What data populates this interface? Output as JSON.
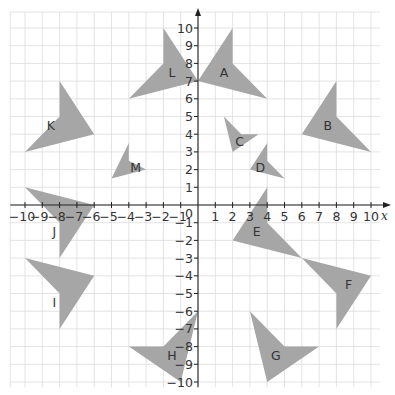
{
  "figure": {
    "type": "coordinate-grid-with-shapes",
    "x_range": [
      -10,
      10
    ],
    "y_range": [
      -10,
      10
    ],
    "x_axis_label": "x",
    "origin_label": "0",
    "x_ticks": [
      -10,
      -9,
      -8,
      -7,
      -6,
      -5,
      -4,
      -3,
      -2,
      -1,
      1,
      2,
      3,
      4,
      5,
      6,
      7,
      8,
      9,
      10
    ],
    "y_ticks": [
      -10,
      -9,
      -8,
      -7,
      -6,
      -5,
      -4,
      -3,
      -2,
      -1,
      1,
      2,
      3,
      4,
      5,
      6,
      7,
      8,
      9,
      10
    ],
    "colors": {
      "shape_fill": "#a6a6a6",
      "grid": "#dcdcdc",
      "axis": "#222222",
      "text": "#333333"
    }
  },
  "shapes": [
    {
      "label": "A",
      "vertices": [
        [
          0,
          7
        ],
        [
          2,
          10
        ],
        [
          2,
          8
        ],
        [
          4,
          6
        ]
      ],
      "label_pos": [
        1.5,
        7.5
      ]
    },
    {
      "label": "L",
      "vertices": [
        [
          0,
          7
        ],
        [
          -2,
          10
        ],
        [
          -2,
          8
        ],
        [
          -4,
          6
        ]
      ],
      "label_pos": [
        -1.5,
        7.5
      ]
    },
    {
      "label": "B",
      "vertices": [
        [
          6,
          4
        ],
        [
          8,
          7
        ],
        [
          8,
          5
        ],
        [
          10,
          3
        ]
      ],
      "label_pos": [
        7.5,
        4.5
      ]
    },
    {
      "label": "K",
      "vertices": [
        [
          -10,
          3
        ],
        [
          -8,
          5
        ],
        [
          -8,
          7
        ],
        [
          -6,
          4
        ]
      ],
      "label_pos": [
        -8.5,
        4.5
      ]
    },
    {
      "label": "C",
      "vertices": [
        [
          1.5,
          5
        ],
        [
          2.5,
          4
        ],
        [
          3.5,
          4
        ],
        [
          2,
          3
        ]
      ],
      "label_pos": [
        2.4,
        3.6
      ]
    },
    {
      "label": "D",
      "vertices": [
        [
          4,
          3.5
        ],
        [
          4,
          2.5
        ],
        [
          5,
          1.5
        ],
        [
          3,
          2
        ]
      ],
      "label_pos": [
        3.6,
        2.1
      ]
    },
    {
      "label": "M",
      "vertices": [
        [
          -4,
          3.5
        ],
        [
          -4,
          2.5
        ],
        [
          -3,
          2
        ],
        [
          -5,
          1.5
        ]
      ],
      "label_pos": [
        -3.6,
        2.1
      ]
    },
    {
      "label": "J",
      "vertices": [
        [
          -10,
          1
        ],
        [
          -6,
          0
        ],
        [
          -8,
          -3
        ],
        [
          -8,
          -1
        ]
      ],
      "label_pos": [
        -8.3,
        -1.5
      ]
    },
    {
      "label": "I",
      "vertices": [
        [
          -10,
          -3
        ],
        [
          -6,
          -4
        ],
        [
          -8,
          -7
        ],
        [
          -8,
          -5
        ]
      ],
      "label_pos": [
        -8.3,
        -5.5
      ]
    },
    {
      "label": "E",
      "vertices": [
        [
          4,
          1
        ],
        [
          4,
          -1
        ],
        [
          6,
          -3
        ],
        [
          2,
          -2
        ]
      ],
      "label_pos": [
        3.4,
        -1.5
      ]
    },
    {
      "label": "F",
      "vertices": [
        [
          6,
          -3
        ],
        [
          10,
          -4
        ],
        [
          8,
          -7
        ],
        [
          8,
          -5
        ]
      ],
      "label_pos": [
        8.7,
        -4.5
      ]
    },
    {
      "label": "G",
      "vertices": [
        [
          3,
          -6
        ],
        [
          5,
          -8
        ],
        [
          7,
          -8
        ],
        [
          4,
          -10
        ]
      ],
      "label_pos": [
        4.5,
        -8.5
      ]
    },
    {
      "label": "H",
      "vertices": [
        [
          0,
          -6
        ],
        [
          -2,
          -8
        ],
        [
          -4,
          -8
        ],
        [
          -1,
          -10
        ]
      ],
      "label_pos": [
        -1.5,
        -8.5
      ]
    }
  ]
}
